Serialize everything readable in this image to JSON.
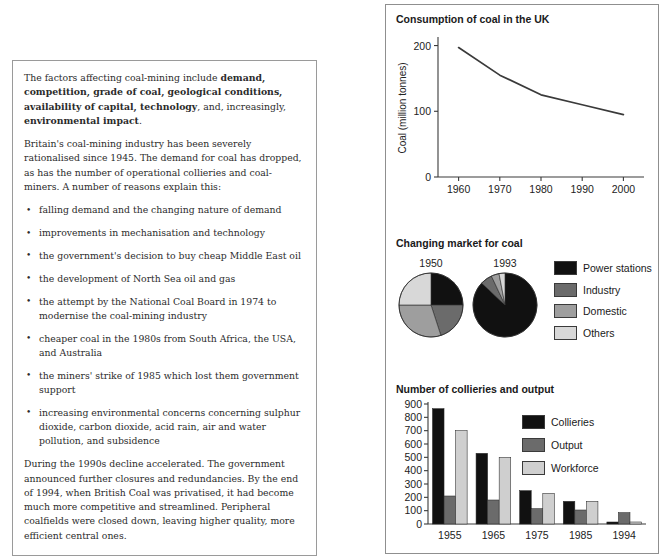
{
  "article": {
    "intro_parts": [
      {
        "text": "The factors affecting coal-mining include ",
        "bold": false
      },
      {
        "text": "demand, competition, grade of coal, geological conditions, availability of capital, technology",
        "bold": true
      },
      {
        "text": ", and, increasingly, ",
        "bold": false
      },
      {
        "text": "environmental impact",
        "bold": true
      },
      {
        "text": ".",
        "bold": false
      }
    ],
    "intro_plain": "The factors affecting coal-mining include demand, competition, grade of coal, geological conditions, availability of capital, technology, and, increasingly, environmental impact.",
    "paragraph_2": "Britain's coal-mining industry has been severely rationalised since 1945. The demand for coal has dropped, as has the number of operational collieries and coal-miners. A number of reasons explain this:",
    "reasons": [
      "falling demand and the changing nature of demand",
      "improvements in mechanisation and technology",
      "the government's decision to buy cheap Middle East oil",
      "the development of North Sea oil and gas",
      "the attempt by the National Coal Board in 1974 to modernise the coal-mining industry",
      "cheaper coal in the 1980s from South Africa, the USA, and Australia",
      "the miners' strike of 1985 which lost them government support",
      "increasing environmental concerns concerning sulphur dioxide, carbon dioxide, acid rain, air and water pollution, and subsidence"
    ],
    "paragraph_final": "During the 1990s decline accelerated. The government announced further closures and redundancies. By the end of 1994, when British Coal was privatised, it had become much more competitive and streamlined. Peripheral coalfields were closed down, leaving higher quality, more efficient central ones."
  },
  "colors": {
    "power_stations": "#111111",
    "industry": "#6b6b6b",
    "domestic": "#9e9e9e",
    "others": "#d8d8d8",
    "collieries": "#111111",
    "output": "#6b6b6b",
    "workforce": "#cfcfcf",
    "axis": "#3a3a3a",
    "panel_border": "#8f8f8f",
    "text_border": "#9a9a9a"
  },
  "chart_data": [
    {
      "type": "line",
      "title": "Consumption of coal in the UK",
      "xlabel": "",
      "ylabel": "Coal (million tonnes)",
      "x": [
        1960,
        1970,
        1980,
        1990,
        2000
      ],
      "values": [
        197,
        155,
        125,
        110,
        95
      ],
      "x_ticks": [
        "1960",
        "1970",
        "1980",
        "1990",
        "2000"
      ],
      "y_ticks": [
        "0",
        "100",
        "200"
      ],
      "y_tick_values": [
        0,
        100,
        200
      ],
      "xlim": [
        1955,
        2005
      ],
      "ylim": [
        0,
        210
      ],
      "grid": false,
      "legend": "none"
    },
    {
      "type": "pie",
      "title": "Changing market for coal",
      "legend_position": "right",
      "legend": [
        "Power stations",
        "Industry",
        "Domestic",
        "Others"
      ],
      "pies": [
        {
          "label": "1950",
          "labels": [
            "Power stations",
            "Industry",
            "Domestic",
            "Others"
          ],
          "values": [
            25,
            20,
            30,
            25
          ]
        },
        {
          "label": "1993",
          "labels": [
            "Power stations",
            "Industry",
            "Domestic",
            "Others"
          ],
          "values": [
            87,
            6,
            4,
            3
          ]
        }
      ]
    },
    {
      "type": "bar",
      "title": "Number of collieries and output",
      "xlabel": "",
      "ylabel": "",
      "categories": [
        "1955",
        "1965",
        "1975",
        "1985",
        "1994"
      ],
      "series": [
        {
          "name": "Collieries",
          "values": [
            865,
            530,
            250,
            170,
            15
          ]
        },
        {
          "name": "Output",
          "values": [
            210,
            180,
            115,
            105,
            85
          ]
        },
        {
          "name": "Workforce",
          "values": [
            700,
            500,
            230,
            170,
            15
          ]
        }
      ],
      "y_ticks": [
        "0",
        "100",
        "200",
        "300",
        "400",
        "500",
        "600",
        "700",
        "800",
        "900"
      ],
      "y_tick_values": [
        0,
        100,
        200,
        300,
        400,
        500,
        600,
        700,
        800,
        900
      ],
      "ylim": [
        0,
        900
      ],
      "grid": false,
      "legend_position": "top-right"
    }
  ]
}
